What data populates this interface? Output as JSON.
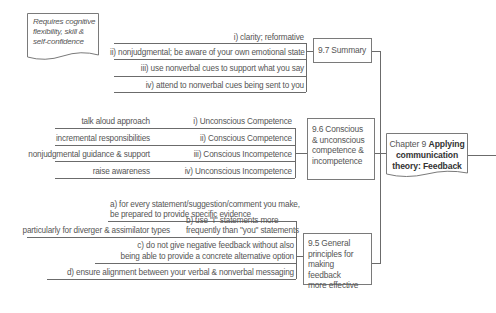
{
  "callout": {
    "lines": [
      "Requires cognitive",
      "flexibility, skill &",
      "self-confidence"
    ]
  },
  "central": {
    "prefix": "Chapter 9",
    "title_line1": "Applying",
    "title_line2": "communication",
    "title_line3": "theory: Feedback"
  },
  "sections": {
    "summary": {
      "label": "9.7 Summary",
      "items": [
        "i) clarity; reformative",
        "ii) nonjudgmental; be aware of your own emotional state",
        "iii) use nonverbal cues to support what you say",
        "iv) attend to nonverbal cues being sent to you"
      ]
    },
    "competence": {
      "label_lines": [
        "9.6 Conscious",
        "& unconscious",
        "competence &",
        "incompetence"
      ],
      "items": [
        {
          "stage": "i) Unconscious Competence",
          "approach": "talk aloud approach"
        },
        {
          "stage": "ii) Conscious Competence",
          "approach": "incremental responsibilities"
        },
        {
          "stage": "iii) Conscious Incompetence",
          "approach": "nonjudgmental guidance & support"
        },
        {
          "stage": "iv) Unconscious Incompetence",
          "approach": "raise awareness"
        }
      ]
    },
    "principles": {
      "label_lines": [
        "9.5 General",
        "principles for",
        "making feedback",
        "more effective"
      ],
      "items": {
        "a_line1": "a) for every statement/suggestion/comment you make,",
        "a_line2": "be prepared to provide specific evidence",
        "b_line1": "b) use \"I\" statements more",
        "b_line2": "frequently than \"you\" statements",
        "b_note": "particularly for diverger & assimilator types",
        "c_line1": "c) do not give negative feedback without also",
        "c_line2": "being able to provide a concrete alternative option",
        "d_line1": "d) ensure alignment between your verbal & nonverbal messaging"
      }
    }
  }
}
